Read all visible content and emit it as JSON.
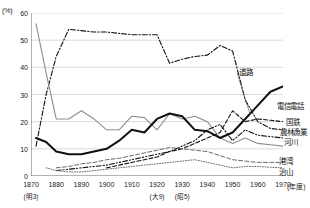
{
  "chart_data": {
    "type": "line",
    "title": "",
    "subtitle": "",
    "xlabel": "年度",
    "ylabel": "%",
    "y_unit_label": "(%)",
    "x_unit_label": "(年度)",
    "xlim": [
      1870,
      1970
    ],
    "ylim": [
      0,
      60
    ],
    "yticks": [
      0,
      10,
      20,
      30,
      40,
      50,
      60
    ],
    "ytick_labels": [
      "0",
      "10",
      "20",
      "30",
      "40",
      "50",
      "60"
    ],
    "xticks": [
      1870,
      1880,
      1890,
      1900,
      1910,
      1920,
      1930,
      1940,
      1950,
      1960,
      1970
    ],
    "xtick_labels": [
      "1870",
      "1880",
      "1890",
      "1900",
      "1910",
      "1920",
      "1930",
      "1940",
      "1950",
      "1960",
      "1970"
    ],
    "xtick_sublabels": [
      {
        "x": 1870,
        "label": "(明3)"
      },
      {
        "x": 1920,
        "label": "(大9)"
      },
      {
        "x": 1930,
        "label": "(昭5)"
      }
    ],
    "grid": "horizontal",
    "legend": "inline-right-labels",
    "series": [
      {
        "name": "国鉄",
        "label": "国鉄",
        "color": "#111111",
        "style": "dashdot",
        "width": 1.1,
        "label_pos": {
          "x": 286,
          "y": 121
        },
        "x": [
          1872,
          1876,
          1880,
          1885,
          1890,
          1895,
          1900,
          1905,
          1910,
          1915,
          1920,
          1925,
          1930,
          1935,
          1940,
          1945,
          1950,
          1955,
          1960,
          1965,
          1970
        ],
        "values": [
          11,
          30,
          44,
          54,
          53.5,
          53,
          53,
          52.5,
          52,
          52,
          52,
          41.5,
          43,
          44,
          44.5,
          48,
          46,
          28,
          20,
          17.5,
          17
        ]
      },
      {
        "name": "河川",
        "label": "河川",
        "color": "#8d8d8d",
        "style": "solid",
        "width": 1.1,
        "label_pos": {
          "x": 284,
          "y": 141
        },
        "x": [
          1872,
          1876,
          1880,
          1885,
          1890,
          1895,
          1900,
          1905,
          1910,
          1915,
          1920,
          1925,
          1930,
          1935,
          1940,
          1945,
          1950,
          1955,
          1960,
          1965,
          1970
        ],
        "values": [
          56,
          38,
          21,
          21,
          24,
          21,
          17,
          17,
          22,
          21.5,
          17,
          23,
          21,
          22,
          20,
          14,
          12,
          14,
          12,
          11.5,
          11
        ]
      },
      {
        "name": "道路",
        "label": "道路",
        "color": "#111111",
        "style": "solid",
        "width": 2.0,
        "label_pos": {
          "x": 239,
          "y": 71
        },
        "x": [
          1872,
          1876,
          1880,
          1885,
          1890,
          1895,
          1900,
          1905,
          1910,
          1915,
          1920,
          1925,
          1930,
          1935,
          1940,
          1945,
          1950,
          1955,
          1960,
          1965,
          1970
        ],
        "values": [
          14,
          12.5,
          9,
          8,
          8,
          9,
          10,
          13,
          17,
          16,
          21,
          23,
          22,
          17,
          16.5,
          14,
          16,
          21,
          26,
          31,
          33
        ]
      },
      {
        "name": "電信電話",
        "label": "電信電話",
        "color": "#111111",
        "style": "dashed",
        "width": 1.1,
        "label_pos": {
          "x": 277,
          "y": 105
        },
        "x": [
          1900,
          1905,
          1910,
          1915,
          1920,
          1925,
          1930,
          1935,
          1940,
          1945,
          1950,
          1955,
          1960,
          1965,
          1970
        ],
        "values": [
          3,
          4,
          5,
          6,
          7,
          9,
          10,
          12,
          14,
          16,
          24,
          20,
          21,
          20.5,
          20
        ]
      },
      {
        "name": "農林漁業",
        "label": "農林漁業",
        "color": "#111111",
        "style": "dashdotdot",
        "width": 1.1,
        "label_pos": {
          "x": 280,
          "y": 131
        },
        "x": [
          1880,
          1885,
          1890,
          1895,
          1900,
          1905,
          1910,
          1915,
          1920,
          1925,
          1930,
          1935,
          1940,
          1945,
          1950,
          1955,
          1960,
          1965,
          1970
        ],
        "values": [
          2,
          2.5,
          3,
          3.5,
          4,
          5,
          6,
          7,
          8,
          9,
          11,
          13,
          17,
          19,
          13,
          17,
          15,
          14.5,
          14
        ]
      },
      {
        "name": "港湾",
        "label": "港湾",
        "color": "#6a6a6a",
        "style": "dashed",
        "width": 1.0,
        "label_pos": {
          "x": 279,
          "y": 160
        },
        "x": [
          1880,
          1885,
          1890,
          1895,
          1900,
          1905,
          1910,
          1915,
          1920,
          1925,
          1930,
          1935,
          1940,
          1945,
          1950,
          1955,
          1960,
          1965,
          1970
        ],
        "values": [
          3,
          3.5,
          4.5,
          5,
          6,
          6.5,
          7.5,
          8.5,
          9.5,
          10.5,
          10,
          9.5,
          9,
          7.5,
          6,
          5.5,
          5,
          5,
          5
        ]
      },
      {
        "name": "治山",
        "label": "治山",
        "color": "#6a6a6a",
        "style": "dotted",
        "width": 1.0,
        "label_pos": {
          "x": 279,
          "y": 171
        },
        "x": [
          1876,
          1880,
          1885,
          1890,
          1895,
          1900,
          1905,
          1910,
          1915,
          1920,
          1925,
          1930,
          1935,
          1940,
          1945,
          1950,
          1955,
          1960,
          1965,
          1970
        ],
        "values": [
          3,
          2,
          1.5,
          1.5,
          2,
          2.5,
          3,
          3.5,
          4,
          4.5,
          5,
          5.5,
          6,
          5,
          4,
          3,
          3.5,
          3.5,
          3.2,
          3
        ]
      }
    ]
  },
  "axis": {
    "y_unit": "(%)",
    "x_unit": "(年度)"
  }
}
